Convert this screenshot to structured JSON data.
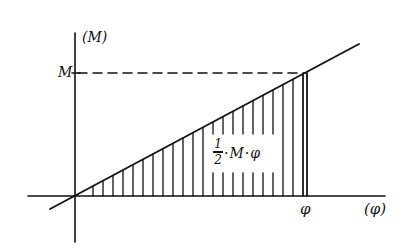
{
  "diagram": {
    "type": "moment-rotation work diagram",
    "axes": {
      "y_label": "(M)",
      "x_label": "(φ)"
    },
    "point_labels": {
      "M_level": "M",
      "phi_value": "φ"
    },
    "area_label": {
      "numerator": "1",
      "denominator": "2",
      "rest": "·M·φ",
      "full": "1/2·M·φ"
    },
    "colors": {
      "ink": "#111111",
      "background": "#ffffff"
    },
    "geometry": {
      "origin": [
        75,
        196
      ],
      "line_start": [
        50,
        209
      ],
      "line_end": [
        359,
        44
      ],
      "M_point": [
        307,
        73
      ],
      "hatch_spacing": 10
    }
  }
}
